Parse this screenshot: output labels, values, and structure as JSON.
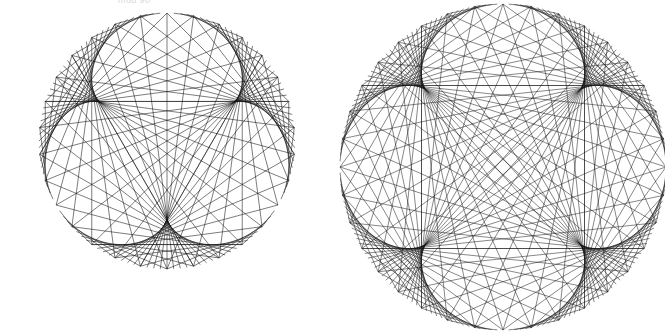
{
  "canvas": {
    "width": 665,
    "height": 332,
    "background": "#ffffff",
    "stroke_color": "#111111"
  },
  "caption": {
    "text": "mod 90",
    "color": "#b9b9b9"
  },
  "figures": [
    {
      "name": "deltoid-times-table",
      "label": "Deltoid envelope times-table circle",
      "center_x": 167,
      "center_y": 141,
      "radius": 128,
      "points": 120,
      "multiplier": 4,
      "rotation_deg": -90,
      "stroke_color": "#111111",
      "stroke_width": 0.55,
      "cusps": 3
    },
    {
      "name": "astroid-times-table",
      "label": "Astroid / four point star envelope times-table circle",
      "center_x": 503,
      "center_y": 167,
      "radius": 163,
      "points": 180,
      "multiplier": 5,
      "rotation_deg": -90,
      "stroke_color": "#111111",
      "stroke_width": 0.5,
      "cusps": 4,
      "center_marker": {
        "name": "center-hole",
        "x": 501,
        "y": 165,
        "size": 5,
        "color": "#ffffff"
      }
    }
  ],
  "chart_data": {
    "type": "scatter",
    "xlabel": "",
    "ylabel": "",
    "series": [
      {
        "name": "Left figure - deltoid",
        "n_points": 120,
        "multiplier": 4,
        "envelope": "3-cusped hypocycloid (deltoid)",
        "center": [
          167,
          141
        ],
        "radius": 128
      },
      {
        "name": "Right figure - astroid",
        "n_points": 180,
        "multiplier": 5,
        "envelope": "4-cusped hypocycloid (astroid)",
        "center": [
          503,
          167
        ],
        "radius": 163
      }
    ],
    "grid": false,
    "legend": "none"
  }
}
